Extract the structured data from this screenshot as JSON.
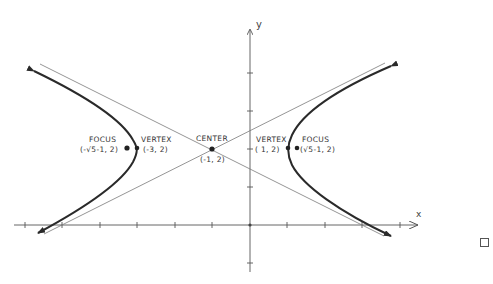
{
  "diagram": {
    "type": "hyperbola",
    "axes": {
      "x_label": "x",
      "y_label": "y",
      "origin_px": [
        250,
        225
      ],
      "unit_px": 37.5,
      "x_ticks": [
        -6,
        -5,
        -4,
        -3,
        -2,
        -1,
        0,
        1,
        2,
        3,
        4
      ],
      "y_ticks": [
        -1,
        0,
        1,
        2,
        3,
        4
      ]
    },
    "points": {
      "center": {
        "label": "CENTER",
        "coords": "(-1, 2)",
        "x": -1,
        "y": 2
      },
      "vertex_left": {
        "label": "VERTEX",
        "coords": "(-3, 2)",
        "x": -3,
        "y": 2
      },
      "vertex_right": {
        "label": "VERTEX",
        "coords": "( 1, 2)",
        "x": 1,
        "y": 2
      },
      "focus_left": {
        "label": "FOCUS",
        "coords": "(-√5-1, 2)",
        "x": -3.236,
        "y": 2
      },
      "focus_right": {
        "label": "FOCUS",
        "coords": "(√5-1, 2)",
        "x": 1.236,
        "y": 2
      }
    },
    "hyperbola": {
      "h": -1,
      "k": 2,
      "a": 2,
      "b": 1
    },
    "colors": {
      "curve": "#2a2a2a",
      "axis": "#555555",
      "asymptote": "#7a7a7a",
      "background": "#ffffff"
    }
  }
}
